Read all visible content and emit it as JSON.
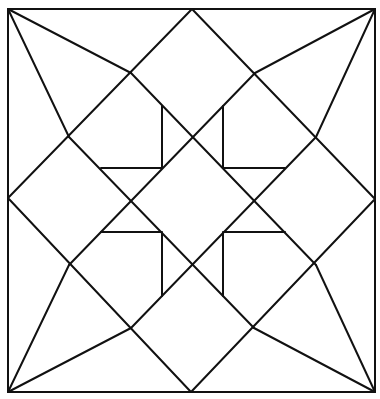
{
  "figure": {
    "stroke_color": "#111111",
    "background_color": "#ffffff",
    "outer_square": {
      "x1": 8,
      "y1": 9,
      "x2": 375,
      "y2": 392
    },
    "midpoints": {
      "top": [
        192,
        9
      ],
      "right": [
        375,
        199
      ],
      "bottom": [
        191,
        392
      ],
      "left": [
        8,
        198
      ]
    },
    "kite_points": {
      "top_left": [
        131,
        73
      ],
      "left_top": [
        69,
        137
      ],
      "top_right": [
        255,
        73
      ],
      "right_top": [
        316,
        137
      ],
      "left_bottom": [
        69,
        265
      ],
      "bottom_left": [
        131,
        328
      ],
      "right_bottom": [
        316,
        265
      ],
      "bottom_right": [
        254,
        328
      ]
    },
    "inner_corners": {
      "tl": {
        "v": [
          162,
          106,
          162,
          168
        ],
        "h": [
          101,
          168,
          162,
          168
        ]
      },
      "tr": {
        "v": [
          223,
          106,
          223,
          168
        ],
        "h": [
          223,
          168,
          285,
          168
        ]
      },
      "bl": {
        "v": [
          162,
          232,
          162,
          296
        ],
        "h": [
          101,
          232,
          162,
          232
        ]
      },
      "br": {
        "v": [
          223,
          232,
          223,
          296
        ],
        "h": [
          223,
          232,
          285,
          232
        ]
      }
    }
  }
}
